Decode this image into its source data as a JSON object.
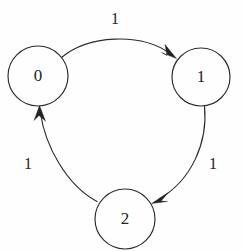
{
  "diagram": {
    "type": "directed-graph",
    "background_color": "#fefefe",
    "stroke_color": "#2b2b2b",
    "text_color": "#242424",
    "nodes": [
      {
        "id": "0",
        "label": "0",
        "cx": 38,
        "cy": 76,
        "r": 30
      },
      {
        "id": "1",
        "label": "1",
        "cx": 201,
        "cy": 77,
        "r": 29
      },
      {
        "id": "2",
        "label": "2",
        "cx": 125,
        "cy": 219,
        "r": 30
      }
    ],
    "edges": [
      {
        "id": "e0",
        "from": "0",
        "to": "1",
        "label": "1",
        "label_x": 115,
        "label_y": 20
      },
      {
        "id": "e1",
        "from": "1",
        "to": "2",
        "label": "1",
        "label_x": 213,
        "label_y": 165
      },
      {
        "id": "e2",
        "from": "2",
        "to": "0",
        "label": "1",
        "label_x": 28,
        "label_y": 165
      }
    ]
  }
}
